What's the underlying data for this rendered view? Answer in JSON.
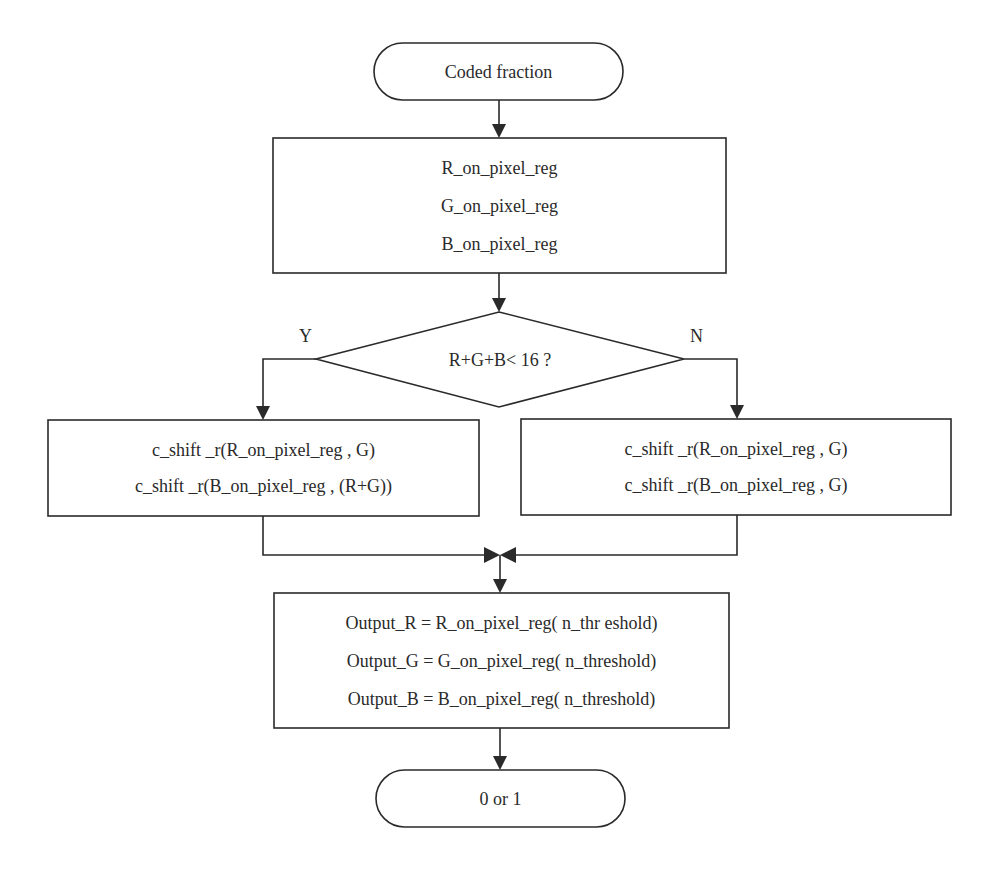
{
  "flowchart": {
    "start": {
      "label": "Coded fraction"
    },
    "registers": {
      "lines": [
        "R_on_pixel_reg",
        "G_on_pixel_reg",
        "B_on_pixel_reg"
      ]
    },
    "decision": {
      "label": "R+G+B< 16 ?",
      "yes_label": "Y",
      "no_label": "N"
    },
    "yes_branch": {
      "lines": [
        "c_shift _r(R_on_pixel_reg , G)",
        "c_shift _r(B_on_pixel_reg , (R+G))"
      ]
    },
    "no_branch": {
      "lines": [
        "c_shift _r(R_on_pixel_reg , G)",
        "c_shift _r(B_on_pixel_reg , G)"
      ]
    },
    "output": {
      "lines": [
        "Output_R = R_on_pixel_reg( n_thr eshold)",
        "Output_G = G_on_pixel_reg( n_threshold)",
        "Output_B = B_on_pixel_reg( n_threshold)"
      ]
    },
    "end": {
      "label": "0 or 1"
    }
  },
  "colors": {
    "stroke": "#2a2a2a",
    "background": "#ffffff"
  }
}
